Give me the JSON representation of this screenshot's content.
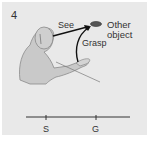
{
  "panel": {
    "number": "4",
    "background": "#e9e9e9"
  },
  "labels": {
    "see": "See",
    "other_object_line1": "Other",
    "other_object_line2": "object",
    "grasp": "Grasp"
  },
  "timeline": {
    "ticks": [
      {
        "label": "S",
        "x": 46
      },
      {
        "label": "G",
        "x": 96
      }
    ]
  },
  "colors": {
    "monkey_fill": "#c9c9c9",
    "monkey_outline": "#8a8a8a",
    "arrow": "#111111",
    "text": "#333333"
  }
}
